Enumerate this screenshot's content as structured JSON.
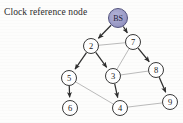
{
  "diagram": {
    "caption": "Clock reference node",
    "background_color": "#fdfdfc",
    "directed_edge_color": "#2e2e2e",
    "plain_edge_color": "#a9a9a9",
    "root_fill_color": "#9a9ac6",
    "root_stroke_color": "#55557f",
    "node_fill_color": "#ffffff",
    "node_stroke_color": "#3a3a3a",
    "nodes": [
      {
        "id": "BS",
        "label": "BS",
        "x": 118,
        "y": 18,
        "r": 9.5,
        "root": true
      },
      {
        "id": "2",
        "label": "2",
        "x": 91,
        "y": 46,
        "r": 7.5,
        "root": false
      },
      {
        "id": "7",
        "label": "7",
        "x": 133,
        "y": 42,
        "r": 7.5,
        "root": false
      },
      {
        "id": "5",
        "label": "5",
        "x": 69,
        "y": 78,
        "r": 7.5,
        "root": false
      },
      {
        "id": "3",
        "label": "3",
        "x": 113,
        "y": 76,
        "r": 7.5,
        "root": false
      },
      {
        "id": "8",
        "label": "8",
        "x": 156,
        "y": 70,
        "r": 7.5,
        "root": false
      },
      {
        "id": "6",
        "label": "6",
        "x": 70,
        "y": 108,
        "r": 7.5,
        "root": false
      },
      {
        "id": "4",
        "label": "4",
        "x": 120,
        "y": 108,
        "r": 7.5,
        "root": false
      },
      {
        "id": "9",
        "label": "9",
        "x": 170,
        "y": 102,
        "r": 7.5,
        "root": false
      }
    ],
    "directed_edges": [
      {
        "from": "BS",
        "to": "2"
      },
      {
        "from": "BS",
        "to": "7"
      },
      {
        "from": "2",
        "to": "5"
      },
      {
        "from": "2",
        "to": "3"
      },
      {
        "from": "7",
        "to": "8"
      },
      {
        "from": "5",
        "to": "6"
      },
      {
        "from": "3",
        "to": "4"
      },
      {
        "from": "8",
        "to": "9"
      }
    ],
    "plain_edges": [
      {
        "from": "2",
        "to": "7"
      },
      {
        "from": "7",
        "to": "3"
      },
      {
        "from": "3",
        "to": "8"
      },
      {
        "from": "5",
        "to": "4"
      },
      {
        "from": "4",
        "to": "9"
      }
    ]
  }
}
